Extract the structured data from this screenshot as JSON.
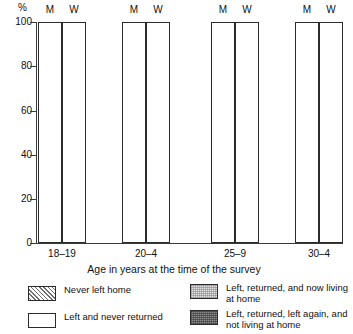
{
  "chart_data": {
    "type": "bar",
    "subtype": "stacked-percentage",
    "title": "",
    "xlabel": "Age in years at the time of the survey",
    "ylabel": "%",
    "ylim": [
      0,
      100
    ],
    "yticks": [
      0,
      20,
      40,
      60,
      80,
      100
    ],
    "grid": false,
    "legend_position": "bottom",
    "categories": [
      "18–19",
      "20–4",
      "25–9",
      "30–4"
    ],
    "subgroups": [
      "M",
      "W"
    ],
    "series": [
      {
        "name": "Never left home",
        "values": {
          "18–19": {
            "M": 68,
            "W": 62
          },
          "20–4": {
            "M": 31.5,
            "W": 20
          },
          "25–9": {
            "M": 6,
            "W": 2
          },
          "30–4": {
            "M": 1,
            "W": 1
          }
        }
      },
      {
        "name": "Left and never returned",
        "values": {
          "18–19": {
            "M": 15,
            "W": 23
          },
          "20–4": {
            "M": 38.5,
            "W": 50
          },
          "25–9": {
            "M": 67,
            "W": 71
          },
          "30–4": {
            "M": 63,
            "W": 66
          }
        }
      },
      {
        "name": "Left, returned, and now living at home",
        "values": {
          "18–19": {
            "M": 14,
            "W": 13
          },
          "20–4": {
            "M": 14,
            "W": 9
          },
          "25–9": {
            "M": 10,
            "W": 4
          },
          "30–4": {
            "M": 3,
            "W": 3
          }
        }
      },
      {
        "name": "Left, returned, left again, and not living at home",
        "values": {
          "18–19": {
            "M": 3,
            "W": 2
          },
          "20–4": {
            "M": 16,
            "W": 21
          },
          "25–9": {
            "M": 17,
            "W": 23
          },
          "30–4": {
            "M": 33,
            "W": 30
          }
        }
      }
    ]
  },
  "axis": {
    "y_unit": "%",
    "ticks": [
      "100",
      "80",
      "60",
      "40",
      "20",
      "0"
    ],
    "x_title": "Age in years at the time of the survey"
  },
  "groups": [
    {
      "label": "18–19",
      "m": "M",
      "w": "W"
    },
    {
      "label": "20–4",
      "m": "M",
      "w": "W"
    },
    {
      "label": "25–9",
      "m": "M",
      "w": "W"
    },
    {
      "label": "30–4",
      "m": "M",
      "w": "W"
    }
  ],
  "legend": {
    "items": [
      {
        "label": "Never left home",
        "swatch": "hatched-diagonal"
      },
      {
        "label": "Left and never returned",
        "swatch": "white"
      },
      {
        "label": "Left, returned, and now living at home",
        "swatch": "light-gray-stipple"
      },
      {
        "label": "Left, returned, left again, and not living at home",
        "swatch": "dark-gray-stipple"
      }
    ]
  }
}
